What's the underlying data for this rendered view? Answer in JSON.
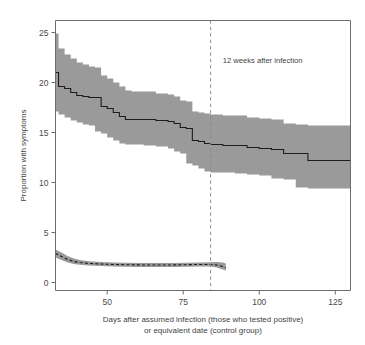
{
  "chart_data": {
    "type": "line",
    "title": "",
    "subtitle": "",
    "xlabel_line1": "Days after assumed infection (those who tested positive)",
    "xlabel_line2": "or equivalent date (control group)",
    "ylabel": "Proportion with symptoms",
    "xlim": [
      33,
      130
    ],
    "ylim": [
      -0.8,
      26.2
    ],
    "xticks": [
      50,
      75,
      100,
      125
    ],
    "xtick_labels": [
      "50",
      "75",
      "100",
      "125"
    ],
    "yticks": [
      0,
      5,
      10,
      15,
      20,
      25
    ],
    "ytick_labels": [
      "0",
      "5",
      "10",
      "15",
      "20",
      "25"
    ],
    "grid": false,
    "legend": "none",
    "band_color": "#9a9a9a",
    "line_color": "#1c1c1c",
    "annotations": [
      {
        "name": "12-weeks-marker",
        "text": "12 weeks after infection",
        "x": 84,
        "line_style": "dashed",
        "line_color": "#8a8a8a",
        "text_x": 88,
        "text_y": 22.0
      }
    ],
    "series": [
      {
        "name": "Tested positive group",
        "style": "solid",
        "step": true,
        "x": [
          33,
          34,
          36,
          38,
          40,
          42,
          44,
          46,
          48,
          50,
          52,
          54,
          56,
          58,
          62,
          66,
          70,
          72,
          74,
          76,
          78,
          80,
          82,
          84,
          88,
          92,
          96,
          100,
          104,
          108,
          112,
          116,
          122,
          130
        ],
        "values": [
          21.0,
          19.6,
          19.4,
          19.0,
          18.7,
          18.6,
          18.5,
          18.5,
          17.6,
          17.4,
          17.0,
          16.6,
          16.3,
          16.3,
          16.3,
          16.2,
          16.1,
          15.9,
          15.5,
          15.4,
          14.2,
          14.1,
          13.9,
          13.8,
          13.7,
          13.7,
          13.5,
          13.4,
          13.3,
          12.9,
          12.9,
          12.2,
          12.2,
          12.2
        ],
        "ci_lower": [
          18.0,
          17.1,
          16.8,
          16.5,
          16.2,
          16.0,
          15.8,
          15.7,
          15.1,
          14.9,
          14.5,
          14.2,
          13.9,
          13.8,
          13.8,
          13.7,
          13.6,
          13.4,
          13.1,
          12.9,
          11.9,
          11.7,
          11.4,
          11.1,
          11.0,
          11.0,
          10.9,
          10.8,
          10.7,
          10.4,
          10.3,
          9.5,
          9.4,
          9.4
        ],
        "ci_upper": [
          24.9,
          23.4,
          22.8,
          22.4,
          22.0,
          21.8,
          21.6,
          21.5,
          20.7,
          20.4,
          20.0,
          19.6,
          19.2,
          19.1,
          19.1,
          18.9,
          18.8,
          18.6,
          18.2,
          18.1,
          17.1,
          17.0,
          16.9,
          16.8,
          16.7,
          16.7,
          16.5,
          16.4,
          16.3,
          15.9,
          15.8,
          15.7,
          15.7,
          15.7
        ]
      },
      {
        "name": "Control group",
        "style": "dashed",
        "step": false,
        "x": [
          33,
          35,
          37,
          39,
          41,
          44,
          48,
          52,
          56,
          60,
          64,
          68,
          72,
          76,
          80,
          84,
          86,
          88,
          89
        ],
        "values": [
          2.9,
          2.6,
          2.3,
          2.1,
          2.0,
          1.9,
          1.85,
          1.8,
          1.78,
          1.76,
          1.75,
          1.75,
          1.76,
          1.78,
          1.8,
          1.8,
          1.75,
          1.6,
          1.5
        ],
        "ci_lower": [
          2.5,
          2.25,
          2.0,
          1.85,
          1.78,
          1.7,
          1.65,
          1.6,
          1.58,
          1.56,
          1.55,
          1.55,
          1.56,
          1.58,
          1.6,
          1.6,
          1.5,
          1.3,
          1.2
        ],
        "ci_upper": [
          3.3,
          3.0,
          2.65,
          2.4,
          2.25,
          2.12,
          2.05,
          2.0,
          1.98,
          1.96,
          1.95,
          1.95,
          1.96,
          1.98,
          2.0,
          2.02,
          2.05,
          2.0,
          1.9
        ]
      }
    ]
  }
}
